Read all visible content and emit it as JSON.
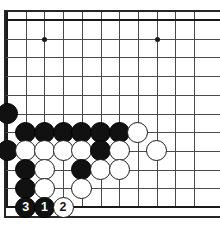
{
  "diagram": {
    "type": "go-board-problem",
    "kind": "go-game-diagram",
    "board": {
      "origin_x": 7,
      "origin_y": 20,
      "spacing": 18.7,
      "cols": 11,
      "rows": 11,
      "line_color": "#4a4a4a",
      "edge_color": "#1a1a1a",
      "background": "#ffffff",
      "left_edge_is_board_border": true,
      "bottom_edge_is_board_border": true,
      "top_edge_is_board_border": true
    },
    "star_points": [
      {
        "col": 3,
        "row": 2
      },
      {
        "col": 9,
        "row": 2
      }
    ],
    "stones": [
      {
        "col": 1,
        "row": 6,
        "color": "black",
        "label": ""
      },
      {
        "col": 1,
        "row": 8,
        "color": "black",
        "label": ""
      },
      {
        "col": 2,
        "row": 7,
        "color": "black",
        "label": ""
      },
      {
        "col": 3,
        "row": 7,
        "color": "black",
        "label": ""
      },
      {
        "col": 4,
        "row": 7,
        "color": "black",
        "label": ""
      },
      {
        "col": 5,
        "row": 7,
        "color": "black",
        "label": ""
      },
      {
        "col": 6,
        "row": 7,
        "color": "black",
        "label": ""
      },
      {
        "col": 7,
        "row": 7,
        "color": "black",
        "label": ""
      },
      {
        "col": 8,
        "row": 7,
        "color": "white",
        "label": ""
      },
      {
        "col": 2,
        "row": 8,
        "color": "white",
        "label": ""
      },
      {
        "col": 3,
        "row": 8,
        "color": "white",
        "label": ""
      },
      {
        "col": 4,
        "row": 8,
        "color": "white",
        "label": ""
      },
      {
        "col": 5,
        "row": 8,
        "color": "white",
        "label": ""
      },
      {
        "col": 6,
        "row": 8,
        "color": "black",
        "label": ""
      },
      {
        "col": 7,
        "row": 8,
        "color": "white",
        "label": ""
      },
      {
        "col": 9,
        "row": 8,
        "color": "white",
        "label": ""
      },
      {
        "col": 2,
        "row": 9,
        "color": "black",
        "label": ""
      },
      {
        "col": 3,
        "row": 9,
        "color": "white",
        "label": ""
      },
      {
        "col": 5,
        "row": 9,
        "color": "black",
        "label": ""
      },
      {
        "col": 6,
        "row": 9,
        "color": "white",
        "label": ""
      },
      {
        "col": 7,
        "row": 9,
        "color": "white",
        "label": ""
      },
      {
        "col": 2,
        "row": 10,
        "color": "black",
        "label": ""
      },
      {
        "col": 3,
        "row": 10,
        "color": "white",
        "label": ""
      },
      {
        "col": 5,
        "row": 10,
        "color": "white",
        "label": ""
      },
      {
        "col": 2,
        "row": 11,
        "color": "black",
        "label": "3"
      },
      {
        "col": 3,
        "row": 11,
        "color": "black",
        "label": "1"
      },
      {
        "col": 4,
        "row": 11,
        "color": "white",
        "label": "2"
      }
    ],
    "move_sequence": [
      {
        "number": "1",
        "color": "black",
        "col": 3,
        "row": 11
      },
      {
        "number": "2",
        "color": "white",
        "col": 4,
        "row": 11
      },
      {
        "number": "3",
        "color": "black",
        "col": 2,
        "row": 11
      }
    ],
    "colors": {
      "black_stone": "#111111",
      "white_stone": "#ffffff",
      "stone_outline": "#1a1a1a",
      "grid": "#4a4a4a",
      "board_border": "#262626"
    }
  }
}
